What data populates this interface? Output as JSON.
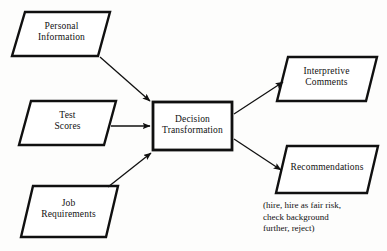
{
  "diagram": {
    "stroke_color": "#101010",
    "fill_color": "#ffffff",
    "background_color": "#fdfdfc",
    "inputs": [
      {
        "id": "personal-information",
        "label": "Personal\nInformation"
      },
      {
        "id": "test-scores",
        "label": "Test\nScores"
      },
      {
        "id": "job-requirements",
        "label": "Job\nRequirements"
      }
    ],
    "process": {
      "id": "decision-transformation",
      "label": "Decision\nTransformation"
    },
    "outputs": [
      {
        "id": "interpretive-comments",
        "label": "Interpretive\nComments"
      },
      {
        "id": "recommendations",
        "label": "Recommendations"
      }
    ],
    "caption": "(hire, hire as fair risk,\ncheck background\nfurther, reject)"
  }
}
